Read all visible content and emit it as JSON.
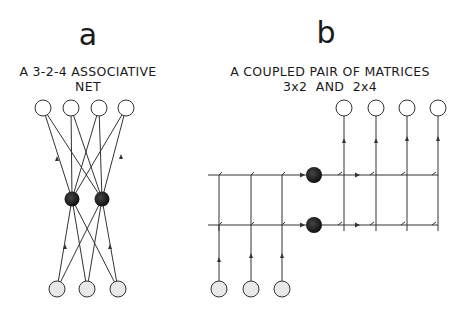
{
  "panels": [
    {
      "letter": "a",
      "caption_line1": "A 3-2-4 ASSOCIATIVE",
      "caption_line2": "NET",
      "layers": {
        "input": {
          "count": 3,
          "fill": "#e8e8e8"
        },
        "hidden": {
          "count": 2,
          "fill": "#1e1e1e"
        },
        "output": {
          "count": 4,
          "fill": "#ffffff"
        }
      }
    },
    {
      "letter": "b",
      "caption_line1": "A COUPLED PAIR OF MATRICES",
      "caption_line2": "3x2  AND  2x4",
      "layers": {
        "input": {
          "count": 3,
          "fill": "#e8e8e8"
        },
        "hidden": {
          "count": 2,
          "fill": "#1e1e1e"
        },
        "output": {
          "count": 4,
          "fill": "#ffffff"
        }
      }
    }
  ],
  "colors": {
    "stroke": "#333333",
    "background": "#ffffff"
  }
}
